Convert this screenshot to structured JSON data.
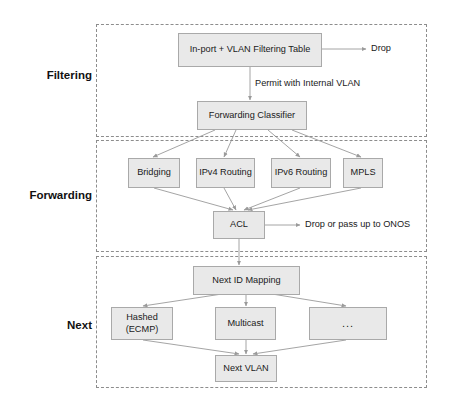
{
  "diagram": {
    "colors": {
      "node_fill": "#e9e9e9",
      "node_border": "#a9a9a9",
      "section_border": "#8d8d8d",
      "edge": "#9a9a9a",
      "text": "#1a1a1a"
    },
    "sections": [
      {
        "id": "filtering",
        "label": "Filtering"
      },
      {
        "id": "forwarding",
        "label": "Forwarding"
      },
      {
        "id": "next",
        "label": "Next"
      }
    ],
    "nodes": [
      {
        "id": "inport_vlan",
        "label": "In-port + VLAN Filtering Table"
      },
      {
        "id": "fwd_classifier",
        "label": "Forwarding Classifier"
      },
      {
        "id": "bridging",
        "label": "Bridging"
      },
      {
        "id": "ipv4_routing",
        "label": "IPv4 Routing"
      },
      {
        "id": "ipv6_routing",
        "label": "IPv6 Routing"
      },
      {
        "id": "mpls",
        "label": "MPLS"
      },
      {
        "id": "acl",
        "label": "ACL"
      },
      {
        "id": "next_id_map",
        "label": "Next ID Mapping"
      },
      {
        "id": "hashed_ecmp",
        "label": "Hashed (ECMP)"
      },
      {
        "id": "multicast",
        "label": "Multicast"
      },
      {
        "id": "more",
        "label": "..."
      },
      {
        "id": "next_vlan",
        "label": "Next VLAN"
      }
    ],
    "annotations": [
      {
        "id": "drop",
        "label": "Drop"
      },
      {
        "id": "permit_vlan",
        "label": "Permit with Internal VLAN"
      },
      {
        "id": "drop_or_pass_onos",
        "label": "Drop or pass up to ONOS"
      }
    ]
  }
}
